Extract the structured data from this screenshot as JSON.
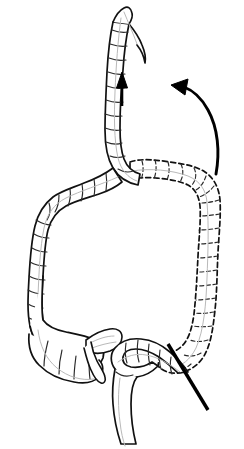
{
  "figure": {
    "title": "Colon mobilization and sigmoid transection diagram",
    "style": "black and white line drawing",
    "background_color": "#ffffff",
    "line_color": "#111111",
    "accent_color": "#000000",
    "haustra_color": "#2a2a2a",
    "taenia_color": "#b9b9b9",
    "width": 244,
    "height": 449
  },
  "legend": {
    "solid_meaning": "mobilized / new position",
    "dashed_meaning": "original position"
  },
  "structures": [
    {
      "id": "elevated-limb",
      "label": "Elevated colon limb",
      "line_style": "solid",
      "position": "top center"
    },
    {
      "id": "cut-end",
      "label": "Divided open end",
      "line_style": "solid",
      "position": "top"
    },
    {
      "id": "transverse-colon",
      "label": "Transverse colon",
      "line_style": "dashed",
      "position": "upper right"
    },
    {
      "id": "splenic-flexure",
      "label": "Splenic flexure",
      "line_style": "dashed",
      "position": "right upper"
    },
    {
      "id": "descending-colon",
      "label": "Descending colon",
      "line_style": "dashed",
      "position": "right"
    },
    {
      "id": "hepatic-flexure",
      "label": "Hepatic flexure",
      "line_style": "solid",
      "position": "upper left"
    },
    {
      "id": "ascending-colon",
      "label": "Ascending colon",
      "line_style": "solid",
      "position": "left"
    },
    {
      "id": "cecum",
      "label": "Cecum",
      "line_style": "solid",
      "position": "lower left"
    },
    {
      "id": "appendix",
      "label": "Appendix",
      "line_style": "solid",
      "position": "lower left"
    },
    {
      "id": "terminal-ileum",
      "label": "Terminal ileum",
      "line_style": "solid",
      "position": "lower left"
    },
    {
      "id": "sigmoid-colon",
      "label": "Sigmoid colon",
      "line_style": "solid",
      "position": "bottom center"
    },
    {
      "id": "rectum",
      "label": "Rectum",
      "line_style": "solid",
      "position": "bottom"
    }
  ],
  "annotations": {
    "straight_arrow": {
      "name": "elevation arrow",
      "direction": "up",
      "meaning": "direction of elevation",
      "x1": 122,
      "y1": 106,
      "x2": 122,
      "y2": 72
    },
    "curved_arrow": {
      "name": "rotation arrow",
      "direction": "counterclockwise, up and to the left",
      "meaning": "direction of rotation",
      "start_x": 216,
      "start_y": 172,
      "end_x": 174,
      "end_y": 86
    },
    "transection_line": {
      "name": "transection line",
      "meaning": "line of division / resection",
      "x1": 168,
      "y1": 344,
      "x2": 208,
      "y2": 410
    }
  }
}
